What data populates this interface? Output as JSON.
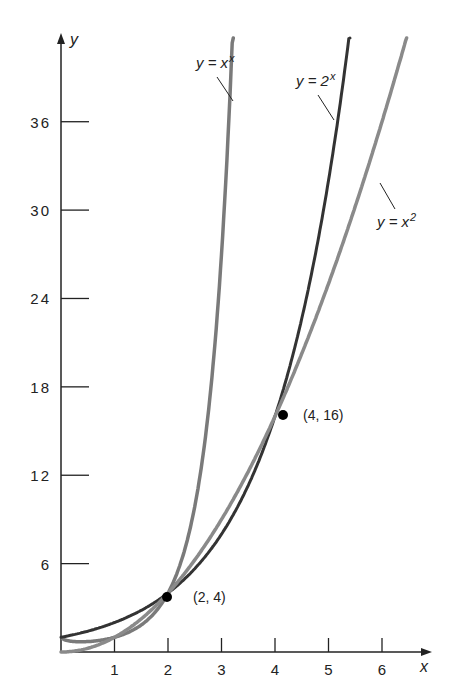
{
  "chart_data": {
    "type": "line",
    "title": "",
    "xlabel": "x",
    "ylabel": "y",
    "xlim": [
      0,
      6.6
    ],
    "ylim": [
      0,
      40
    ],
    "x_ticks": [
      "1",
      "2",
      "3",
      "4",
      "5",
      "6"
    ],
    "y_ticks": [
      "6",
      "12",
      "18",
      "24",
      "30",
      "36"
    ],
    "grid": false,
    "series": [
      {
        "name": "y = x^x",
        "label_main": "y = x",
        "label_sup": "x",
        "color": "#7a7a7a",
        "x": [
          0.05,
          0.5,
          1,
          1.5,
          2,
          2.5,
          3,
          3.3,
          3.6
        ],
        "y": [
          0.86,
          0.71,
          1,
          1.84,
          4,
          9.88,
          27,
          51.4,
          100.6
        ]
      },
      {
        "name": "y = 2^x",
        "label_main": "y = 2",
        "label_sup": "x",
        "color": "#333333",
        "x": [
          0,
          1,
          2,
          3,
          4,
          5,
          5.5
        ],
        "y": [
          1,
          2,
          4,
          8,
          16,
          32,
          45.3
        ]
      },
      {
        "name": "y = x^2",
        "label_main": "y = x",
        "label_sup": "2",
        "color": "#8a8a8a",
        "x": [
          0,
          1,
          2,
          3,
          4,
          5,
          6,
          6.5
        ],
        "y": [
          0,
          1,
          4,
          9,
          16,
          25,
          36,
          42.25
        ]
      }
    ],
    "annotations": [
      {
        "text": "(2, 4)",
        "x": 2,
        "y": 4
      },
      {
        "text": "(4, 16)",
        "x": 4,
        "y": 16
      }
    ]
  }
}
